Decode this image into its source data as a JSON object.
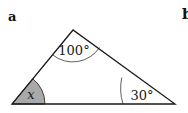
{
  "panel_labels": {
    "a": "a",
    "b": "b"
  },
  "triangle": {
    "vertices": {
      "top": [
        73,
        30
      ],
      "bottom_left": [
        12,
        104
      ],
      "bottom_right": [
        175,
        104
      ]
    },
    "angles": {
      "top": {
        "label": "100°",
        "value": 100
      },
      "bottom_right": {
        "label": "30°",
        "value": 30
      },
      "bottom_left": {
        "label": "x",
        "value": null,
        "shaded": true
      }
    }
  },
  "colors": {
    "stroke": "#1a1a1a",
    "shade": "#a9a9a9",
    "background": "#ffffff"
  }
}
